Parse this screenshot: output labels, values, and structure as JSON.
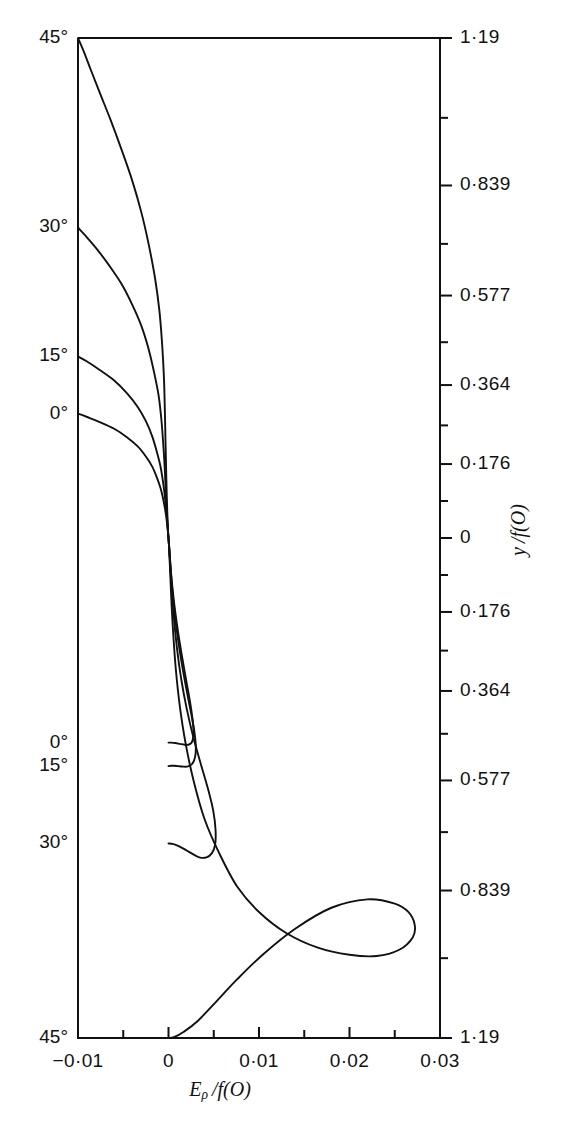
{
  "figure": {
    "background": "#ffffff",
    "line_color": "#111111",
    "frame": {
      "left": 78,
      "right": 440,
      "top": 38,
      "bottom": 1038
    }
  },
  "chart_data": {
    "type": "line",
    "title": "",
    "xlabel": "Eρ / f(O)",
    "ylabel": "y / f(O)",
    "xlim": [
      -0.01,
      0.03
    ],
    "ylim": [
      -1.19,
      1.19
    ],
    "grid": false,
    "legend_position": "none",
    "x_ticks": [
      -0.01,
      0,
      0.01,
      0.02,
      0.03
    ],
    "x_tick_labels": [
      "−0·01",
      "0",
      "0·01",
      "0·02",
      "0·03"
    ],
    "x_minor_ticks": [
      -0.005,
      0.005,
      0.015,
      0.025
    ],
    "y_ticks": [
      1.19,
      0.839,
      0.577,
      0.364,
      0.176,
      0,
      -0.176,
      -0.364,
      -0.577,
      -0.839,
      -1.19
    ],
    "y_tick_labels": [
      "1·19",
      "0·839",
      "0·577",
      "0·364",
      "0·176",
      "0",
      "0·176",
      "0·364",
      "0·577",
      "0·839",
      "1·19"
    ],
    "y_minor_ticks": [
      1.0,
      0.7,
      0.466,
      0.268,
      0.088,
      -0.088,
      -0.268,
      -0.466,
      -0.7,
      -1.0
    ],
    "curve_labels_upper": [
      {
        "text": "45°",
        "y": 1.19
      },
      {
        "text": "30°",
        "y": 0.739
      },
      {
        "text": "15°",
        "y": 0.432
      },
      {
        "text": "0°",
        "y": 0.296
      }
    ],
    "curve_labels_lower": [
      {
        "text": "0°",
        "y": -0.487
      },
      {
        "text": "15°",
        "y": -0.543
      },
      {
        "text": "30°",
        "y": -0.727
      },
      {
        "text": "45°",
        "y": -1.19
      }
    ],
    "series": [
      {
        "name": "45°",
        "points": [
          [
            -0.01,
            1.19
          ],
          [
            -0.0094,
            1.16
          ],
          [
            -0.0086,
            1.115
          ],
          [
            -0.0076,
            1.06
          ],
          [
            -0.0064,
            0.995
          ],
          [
            -0.0052,
            0.925
          ],
          [
            -0.004,
            0.85
          ],
          [
            -0.003,
            0.775
          ],
          [
            -0.0022,
            0.7
          ],
          [
            -0.0015,
            0.62
          ],
          [
            -0.001,
            0.54
          ],
          [
            -0.0007,
            0.46
          ],
          [
            -0.0005,
            0.38
          ],
          [
            -0.0004,
            0.3
          ],
          [
            -0.00032,
            0.22
          ],
          [
            -0.00025,
            0.15
          ],
          [
            -0.00018,
            0.09
          ],
          [
            -0.0001,
            0.04
          ],
          [
            -4e-05,
            0.01
          ],
          [
            0.0,
            0.0
          ],
          [
            6e-05,
            -0.02
          ],
          [
            0.00016,
            -0.07
          ],
          [
            0.0003,
            -0.14
          ],
          [
            0.0005,
            -0.22
          ],
          [
            0.0008,
            -0.31
          ],
          [
            0.00125,
            -0.4
          ],
          [
            0.0019,
            -0.49
          ],
          [
            0.0028,
            -0.58
          ],
          [
            0.004,
            -0.67
          ],
          [
            0.0056,
            -0.75
          ],
          [
            0.0076,
            -0.83
          ],
          [
            0.01,
            -0.89
          ],
          [
            0.013,
            -0.94
          ],
          [
            0.0165,
            -0.975
          ],
          [
            0.02,
            -0.992
          ],
          [
            0.023,
            -0.995
          ],
          [
            0.0255,
            -0.98
          ],
          [
            0.027,
            -0.95
          ],
          [
            0.0272,
            -0.92
          ],
          [
            0.0265,
            -0.89
          ],
          [
            0.025,
            -0.87
          ],
          [
            0.022,
            -0.86
          ],
          [
            0.018,
            -0.88
          ],
          [
            0.014,
            -0.93
          ],
          [
            0.0105,
            -0.99
          ],
          [
            0.0076,
            -1.05
          ],
          [
            0.0052,
            -1.105
          ],
          [
            0.0032,
            -1.15
          ],
          [
            0.0017,
            -1.175
          ],
          [
            0.0006,
            -1.188
          ],
          [
            0.0,
            -1.19
          ]
        ]
      },
      {
        "name": "30°",
        "points": [
          [
            -0.01,
            0.739
          ],
          [
            -0.0092,
            0.72
          ],
          [
            -0.008,
            0.69
          ],
          [
            -0.0066,
            0.65
          ],
          [
            -0.0052,
            0.605
          ],
          [
            -0.004,
            0.555
          ],
          [
            -0.003,
            0.505
          ],
          [
            -0.0022,
            0.45
          ],
          [
            -0.0016,
            0.395
          ],
          [
            -0.0011,
            0.34
          ],
          [
            -0.0008,
            0.285
          ],
          [
            -0.0006,
            0.23
          ],
          [
            -0.00045,
            0.18
          ],
          [
            -0.00034,
            0.13
          ],
          [
            -0.00024,
            0.085
          ],
          [
            -0.00014,
            0.045
          ],
          [
            -6e-05,
            0.015
          ],
          [
            0.0,
            0.0
          ],
          [
            8e-05,
            -0.025
          ],
          [
            0.0002,
            -0.07
          ],
          [
            0.00038,
            -0.13
          ],
          [
            0.00062,
            -0.195
          ],
          [
            0.00095,
            -0.265
          ],
          [
            0.0014,
            -0.335
          ],
          [
            0.002,
            -0.405
          ],
          [
            0.00275,
            -0.475
          ],
          [
            0.0036,
            -0.54
          ],
          [
            0.0044,
            -0.6
          ],
          [
            0.00495,
            -0.65
          ],
          [
            0.0052,
            -0.695
          ],
          [
            0.00515,
            -0.73
          ],
          [
            0.0048,
            -0.75
          ],
          [
            0.0042,
            -0.76
          ],
          [
            0.0034,
            -0.76
          ],
          [
            0.0025,
            -0.75
          ],
          [
            0.0017,
            -0.74
          ],
          [
            0.001,
            -0.732
          ],
          [
            0.00045,
            -0.728
          ],
          [
            0.0,
            -0.727
          ]
        ]
      },
      {
        "name": "15°",
        "points": [
          [
            -0.01,
            0.432
          ],
          [
            -0.009,
            0.42
          ],
          [
            -0.0076,
            0.4
          ],
          [
            -0.006,
            0.375
          ],
          [
            -0.0046,
            0.345
          ],
          [
            -0.0034,
            0.312
          ],
          [
            -0.0025,
            0.278
          ],
          [
            -0.0018,
            0.242
          ],
          [
            -0.0013,
            0.206
          ],
          [
            -0.0009,
            0.172
          ],
          [
            -0.00065,
            0.14
          ],
          [
            -0.00046,
            0.11
          ],
          [
            -0.00032,
            0.082
          ],
          [
            -0.00021,
            0.057
          ],
          [
            -0.00012,
            0.035
          ],
          [
            -5e-05,
            0.015
          ],
          [
            0.0,
            0.0
          ],
          [
            7e-05,
            -0.02
          ],
          [
            0.00018,
            -0.055
          ],
          [
            0.00033,
            -0.1
          ],
          [
            0.00054,
            -0.15
          ],
          [
            0.00082,
            -0.205
          ],
          [
            0.00118,
            -0.26
          ],
          [
            0.0016,
            -0.315
          ],
          [
            0.00205,
            -0.368
          ],
          [
            0.00248,
            -0.415
          ],
          [
            0.00282,
            -0.455
          ],
          [
            0.003,
            -0.488
          ],
          [
            0.003,
            -0.512
          ],
          [
            0.00282,
            -0.53
          ],
          [
            0.0025,
            -0.54
          ],
          [
            0.00205,
            -0.544
          ],
          [
            0.00155,
            -0.544
          ],
          [
            0.00105,
            -0.543
          ],
          [
            0.0006,
            -0.542
          ],
          [
            0.00025,
            -0.542
          ],
          [
            0.0,
            -0.543
          ]
        ]
      },
      {
        "name": "0°",
        "points": [
          [
            -0.01,
            0.296
          ],
          [
            -0.009,
            0.288
          ],
          [
            -0.0076,
            0.276
          ],
          [
            -0.006,
            0.26
          ],
          [
            -0.0046,
            0.24
          ],
          [
            -0.0034,
            0.218
          ],
          [
            -0.0025,
            0.194
          ],
          [
            -0.0018,
            0.17
          ],
          [
            -0.0013,
            0.145
          ],
          [
            -0.0009,
            0.12
          ],
          [
            -0.00063,
            0.097
          ],
          [
            -0.00043,
            0.075
          ],
          [
            -0.00028,
            0.055
          ],
          [
            -0.00017,
            0.037
          ],
          [
            -9e-05,
            0.021
          ],
          [
            -3e-05,
            0.008
          ],
          [
            0.0,
            0.0
          ],
          [
            5e-05,
            -0.015
          ],
          [
            0.00013,
            -0.04
          ],
          [
            0.00025,
            -0.075
          ],
          [
            0.00042,
            -0.115
          ],
          [
            0.00065,
            -0.16
          ],
          [
            0.00095,
            -0.208
          ],
          [
            0.0013,
            -0.257
          ],
          [
            0.00168,
            -0.305
          ],
          [
            0.00205,
            -0.35
          ],
          [
            0.00238,
            -0.39
          ],
          [
            0.00262,
            -0.425
          ],
          [
            0.00275,
            -0.455
          ],
          [
            0.00272,
            -0.476
          ],
          [
            0.00255,
            -0.487
          ],
          [
            0.0022,
            -0.492
          ],
          [
            0.00175,
            -0.492
          ],
          [
            0.00125,
            -0.49
          ],
          [
            0.00075,
            -0.488
          ],
          [
            0.0003,
            -0.487
          ],
          [
            0.0,
            -0.487
          ]
        ]
      }
    ]
  }
}
